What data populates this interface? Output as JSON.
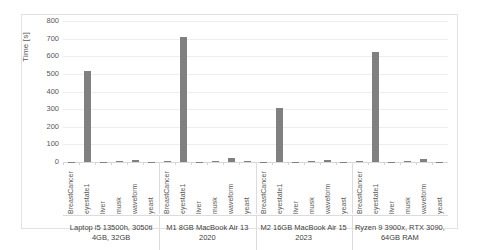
{
  "chart_data": {
    "type": "bar",
    "title": "",
    "xlabel": "",
    "ylabel": "Time [s]",
    "ylim": [
      0,
      800
    ],
    "ytick_step": 100,
    "yticks": [
      "800",
      "700",
      "600",
      "500",
      "400",
      "300",
      "200",
      "100",
      "0"
    ],
    "grid": true,
    "legend": "none",
    "bar_color": "#808080",
    "categories": [
      "BreastCancer",
      "eyestate1",
      "liver",
      "musk",
      "waveform",
      "yeast"
    ],
    "groups": [
      {
        "label": "Laptop i5 13500h, 3050ti 4GB, 32GB",
        "label_line1": "Laptop i5 13500h, 3050ti",
        "label_line2": "4GB, 32GB",
        "values": [
          2,
          517,
          1,
          3,
          14,
          2
        ]
      },
      {
        "label": "M1 8GB MacBook Air 13 2020",
        "label_line1": "M1 8GB MacBook Air 13",
        "label_line2": "2020",
        "values": [
          3,
          712,
          2,
          4,
          24,
          3
        ]
      },
      {
        "label": "M2 16GB MacBook Air 15 2023",
        "label_line1": "M2 16GB MacBook Air 15",
        "label_line2": "2023",
        "values": [
          2,
          308,
          1,
          3,
          11,
          2
        ]
      },
      {
        "label": "Ryzen 9 3900x, RTX 3090, 64GB RAM",
        "label_line1": "Ryzen 9 3900x, RTX 3090,",
        "label_line2": "64GB RAM",
        "values": [
          3,
          623,
          2,
          3,
          18,
          2
        ]
      }
    ]
  }
}
